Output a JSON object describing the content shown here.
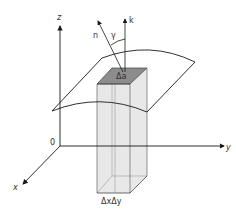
{
  "diagram": {
    "title": "",
    "axes": {
      "x_label": "x",
      "y_label": "y",
      "z_label": "z",
      "origin_label": "0"
    },
    "vectors": {
      "normal_label": "n",
      "k_label": "k",
      "angle_label": "γ"
    },
    "surface_patch_label": "Δa",
    "base_area_label": "ΔxΔy",
    "colors": {
      "line": "#1a1a1a",
      "prism_fill": "#e6e6e6",
      "patch_fill": "#8c8c8c"
    }
  }
}
